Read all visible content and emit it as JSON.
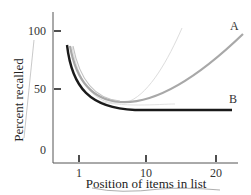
{
  "chart_data": {
    "type": "line",
    "title": "",
    "xlabel": "Position of items in list",
    "ylabel": "Percent recalled",
    "xlim": [
      0,
      22
    ],
    "ylim": [
      0,
      110
    ],
    "x_ticks": [
      1,
      10,
      20
    ],
    "x_tick_labels": [
      "1",
      "10",
      "20"
    ],
    "y_ticks": [
      0,
      50,
      100
    ],
    "y_tick_labels": [
      "0",
      "50",
      "100"
    ],
    "grid": false,
    "legend": "direct labels at line ends",
    "series": [
      {
        "name": "A",
        "color": "#a8a8a8",
        "x": [
          0.9,
          2,
          3,
          5,
          7,
          10,
          13,
          16,
          19,
          21.5
        ],
        "y": [
          88,
          68,
          55,
          44,
          40,
          43,
          55,
          70,
          85,
          98
        ]
      },
      {
        "name": "B",
        "color": "#1a1a1a",
        "x": [
          0.9,
          2,
          3,
          5,
          7,
          10,
          13,
          16,
          19,
          21.5
        ],
        "y": [
          88,
          60,
          47,
          39,
          36,
          35,
          35,
          35,
          35,
          35
        ]
      }
    ],
    "annotations": [
      {
        "text": "A",
        "x": 21.5,
        "y": 103
      },
      {
        "text": "B",
        "x": 21.5,
        "y": 41
      }
    ]
  },
  "axes": {
    "y_title": "Percent recalled",
    "x_title": "Position of items in list",
    "y_ticks": [
      "100",
      "50",
      "0"
    ],
    "x_ticks": [
      "1",
      "10",
      "20"
    ]
  },
  "labels": {
    "series_a": "A",
    "series_b": "B"
  },
  "colors": {
    "axis": "#555555",
    "series_a": "#a8a8a8",
    "series_b": "#1a1a1a",
    "faint_curve": "#dcdcdc"
  }
}
